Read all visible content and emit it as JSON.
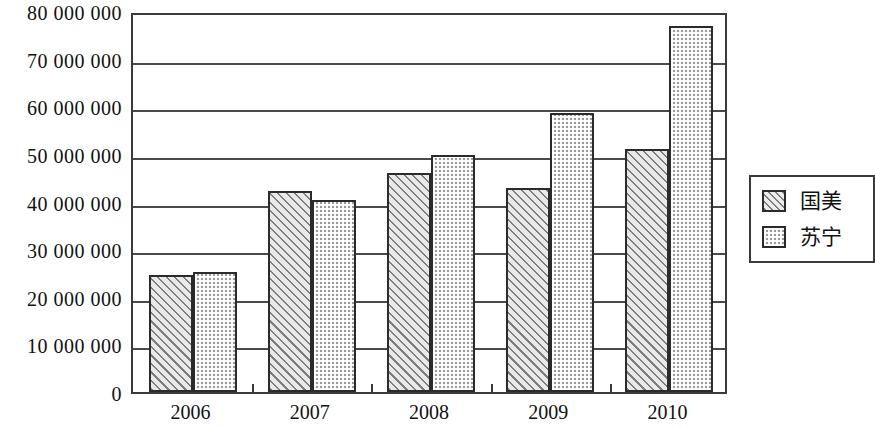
{
  "chart_data": {
    "type": "bar",
    "title": "",
    "subtitle": "",
    "xlabel": "",
    "ylabel": "",
    "categories": [
      "2006",
      "2007",
      "2008",
      "2009",
      "2010"
    ],
    "series": [
      {
        "name": "国美",
        "pattern": "diagonal-hatch",
        "color": "#e9e9e9",
        "values": [
          24500000,
          42300000,
          46000000,
          42800000,
          51000000
        ]
      },
      {
        "name": "苏宁",
        "pattern": "checkered-dots",
        "color": "#9a9a9a",
        "values": [
          25100000,
          40300000,
          49700000,
          58600000,
          76800000
        ]
      }
    ],
    "ylim": [
      0,
      80000000
    ],
    "ytick_values": [
      0,
      10000000,
      20000000,
      30000000,
      40000000,
      50000000,
      60000000,
      70000000,
      80000000
    ],
    "ytick_labels": [
      "0",
      "10 000 000",
      "20 000 000",
      "30 000 000",
      "40 000 000",
      "50 000 000",
      "60 000 000",
      "70 000 000",
      "80 000 000"
    ],
    "grid": true,
    "grid_axis": "y",
    "legend_position": "right",
    "legend_entries": [
      "国美",
      "苏宁"
    ]
  },
  "axes": {
    "y_ticks": [
      {
        "label": "80 000 000",
        "value": 80000000
      },
      {
        "label": "70 000 000",
        "value": 70000000
      },
      {
        "label": "60 000 000",
        "value": 60000000
      },
      {
        "label": "50 000 000",
        "value": 50000000
      },
      {
        "label": "40 000 000",
        "value": 40000000
      },
      {
        "label": "30 000 000",
        "value": 30000000
      },
      {
        "label": "20 000 000",
        "value": 20000000
      },
      {
        "label": "10 000 000",
        "value": 10000000
      },
      {
        "label": "0",
        "value": 0
      }
    ],
    "x_ticks": [
      {
        "label": "2006"
      },
      {
        "label": "2007"
      },
      {
        "label": "2008"
      },
      {
        "label": "2009"
      },
      {
        "label": "2010"
      }
    ]
  },
  "legend": {
    "items": [
      {
        "label": "国美",
        "swatch": "diagonal-hatch-swatch"
      },
      {
        "label": "苏宁",
        "swatch": "checkered-dots-swatch"
      }
    ]
  },
  "colors": {
    "series_a_fill": "#e9e9e9",
    "series_b_fill": "#9a9a9a",
    "axis_line": "#3a3a3a",
    "bar_outline": "#2b2b2b",
    "background": "#ffffff",
    "text": "#111111"
  }
}
